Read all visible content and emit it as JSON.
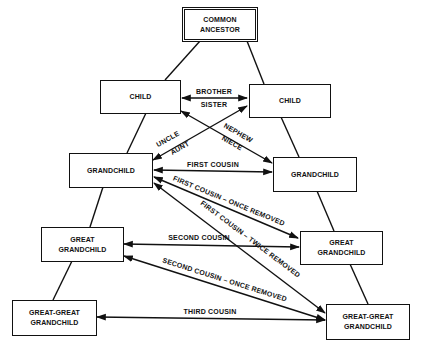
{
  "diagram": {
    "type": "consanguinity-chart",
    "nodes": {
      "common_ancestor": "COMMON\nANCESTOR",
      "child_left": "CHILD",
      "child_right": "CHILD",
      "grandchild_left": "GRANDCHILD",
      "grandchild_right": "GRANDCHILD",
      "great_grandchild_left": "GREAT\nGRANDCHILD",
      "great_grandchild_right": "GREAT\nGRANDCHILD",
      "great_great_grandchild_left": "GREAT-GREAT\nGRANDCHILD",
      "great_great_grandchild_right": "GREAT-GREAT\nGRANDCHILD"
    },
    "relations": {
      "brother": "BROTHER",
      "sister": "SISTER",
      "uncle": "UNCLE",
      "aunt": "AUNT",
      "nephew": "NEPHEW",
      "niece": "NIECE",
      "first_cousin": "FIRST COUSIN",
      "first_cousin_once_removed": "FIRST COUSIN – ONCE REMOVED",
      "first_cousin_twice_removed": "FIRST COUSIN – TWICE REMOVED",
      "second_cousin": "SECOND COUSIN",
      "second_cousin_once_removed": "SECOND COUSIN – ONCE REMOVED",
      "third_cousin": "THIRD COUSIN"
    },
    "colors": {
      "ink": "#111111",
      "background": "#ffffff"
    }
  }
}
